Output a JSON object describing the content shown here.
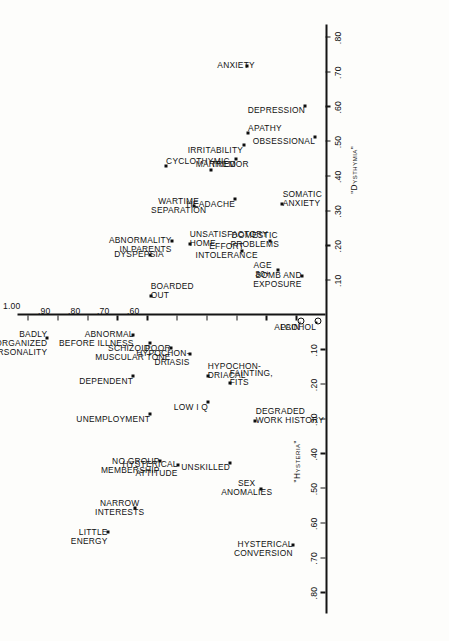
{
  "figure": {
    "axis_x_right_title": "\"Dysthymia\"",
    "axis_x_left_title": "\"Hysteria\"",
    "point_marker": "square-marker",
    "origin_marker": "circled-point-marker"
  },
  "chart_data": {
    "type": "scatter",
    "title": "",
    "xlabel": "\"Hysteria\"  ← | →  \"Dysthymia\"",
    "ylabel": "",
    "xlim": [
      -0.8,
      0.8
    ],
    "ylim": [
      0.0,
      1.0
    ],
    "grid": false,
    "legend": "none",
    "x_ticks_right": [
      ".10",
      ".20",
      ".30",
      ".40",
      ".50",
      ".60",
      ".70",
      ".80"
    ],
    "x_ticks_left": [
      ".10",
      ".20",
      ".30",
      ".40",
      ".50",
      ".60",
      ".70",
      ".80"
    ],
    "y_ticks": [
      ".10",
      ".20",
      ".30",
      ".40",
      ".50",
      ".60",
      ".70",
      ".80",
      ".90",
      "1.00"
    ],
    "points": [
      {
        "label": "BADLY\nORGANIZED\nPERSONALITY",
        "x": -0.065,
        "y": 0.935,
        "align": "right",
        "marker": "square"
      },
      {
        "label": "ABNORMAL\nBEFORE ILLNESS",
        "x": -0.055,
        "y": 0.645,
        "align": "right",
        "marker": "square"
      },
      {
        "label": "DEPENDENT",
        "x": -0.175,
        "y": 0.645,
        "align": "right",
        "marker": "square"
      },
      {
        "label": "SCHIZOID",
        "x": -0.08,
        "y": 0.59,
        "align": "right",
        "marker": "square"
      },
      {
        "label": "UNEMPLOYMENT",
        "x": -0.285,
        "y": 0.59,
        "align": "right",
        "marker": "square"
      },
      {
        "label": "POOR\nMUSCULAR TONE",
        "x": -0.095,
        "y": 0.52,
        "align": "right",
        "marker": "square"
      },
      {
        "label": "NO GROUP\nMEMBERSHIP",
        "x": -0.42,
        "y": 0.555,
        "align": "right",
        "marker": "square"
      },
      {
        "label": "HYPOCHON-\nDRIASIS",
        "x": -0.11,
        "y": 0.455,
        "align": "right",
        "marker": "square"
      },
      {
        "label": "HYSTERICAL\nATTITUDE",
        "x": -0.43,
        "y": 0.495,
        "align": "right",
        "marker": "square"
      },
      {
        "label": "HYPOCHON-\nDRIACAL",
        "x": -0.175,
        "y": 0.395,
        "align": "left",
        "marker": "square"
      },
      {
        "label": "LOW I Q",
        "x": -0.25,
        "y": 0.395,
        "align": "right",
        "marker": "square"
      },
      {
        "label": "FAINTING,\nFITS",
        "x": -0.195,
        "y": 0.32,
        "align": "left",
        "marker": "square"
      },
      {
        "label": "UNSKILLED",
        "x": -0.425,
        "y": 0.32,
        "align": "right",
        "marker": "square"
      },
      {
        "label": "DEGRADED\nWORK HISTORY",
        "x": -0.305,
        "y": 0.235,
        "align": "left",
        "marker": "square"
      },
      {
        "label": "SEX\nANOMALIES",
        "x": -0.5,
        "y": 0.215,
        "align": "center",
        "marker": "square"
      },
      {
        "label": "HYSTERICAL\nCONVERSION",
        "x": -0.66,
        "y": 0.11,
        "align": "right",
        "marker": "square"
      },
      {
        "label": "LITTLE\nENERGY",
        "x": -0.625,
        "y": 0.73,
        "align": "right",
        "marker": "square"
      },
      {
        "label": "NARROW\nINTERESTS",
        "x": -0.555,
        "y": 0.64,
        "align": "center",
        "marker": "square"
      },
      {
        "label": "PAIN",
        "x": -0.02,
        "y": 0.085,
        "align": "right",
        "marker": "circle"
      },
      {
        "label": "ALCOHOL",
        "x": -0.02,
        "y": 0.03,
        "align": "right",
        "marker": "circle"
      },
      {
        "label": "BOARDED\nOUT",
        "x": 0.055,
        "y": 0.585,
        "align": "left",
        "marker": "square"
      },
      {
        "label": "DYSPEPSIA",
        "x": 0.175,
        "y": 0.59,
        "align": "center",
        "marker": "square"
      },
      {
        "label": "ABNORMALITY\nIN PARENTS",
        "x": 0.215,
        "y": 0.515,
        "align": "right",
        "marker": "square"
      },
      {
        "label": "CYCLOTHYMIC",
        "x": 0.43,
        "y": 0.535,
        "align": "left",
        "marker": "square"
      },
      {
        "label": "UNSATISFACTORY\nHOME",
        "x": 0.205,
        "y": 0.455,
        "align": "left",
        "marker": "square"
      },
      {
        "label": "WARTIME\nSEPARATION",
        "x": 0.315,
        "y": 0.44,
        "align": "center",
        "marker": "square"
      },
      {
        "label": "TREMOR",
        "x": 0.42,
        "y": 0.385,
        "align": "left",
        "marker": "square"
      },
      {
        "label": "EFFORT\nINTOLERANCE",
        "x": 0.185,
        "y": 0.28,
        "align": "center",
        "marker": "square"
      },
      {
        "label": "HEADACHE",
        "x": 0.335,
        "y": 0.305,
        "align": "right",
        "marker": "square"
      },
      {
        "label": "MARRIED",
        "x": 0.45,
        "y": 0.3,
        "align": "right",
        "marker": "square"
      },
      {
        "label": "IRRITABILITY",
        "x": 0.49,
        "y": 0.275,
        "align": "right",
        "marker": "square"
      },
      {
        "label": "APATHY",
        "x": 0.525,
        "y": 0.26,
        "align": "left",
        "marker": "square"
      },
      {
        "label": "ANXIETY",
        "x": 0.72,
        "y": 0.265,
        "align": "center",
        "marker": "square"
      },
      {
        "label": "AGE\n30+",
        "x": 0.13,
        "y": 0.16,
        "align": "center",
        "marker": "square"
      },
      {
        "label": "DOMESTIC\nPROBLEMS",
        "x": 0.215,
        "y": 0.185,
        "align": "center",
        "marker": "square"
      },
      {
        "label": "SOMATIC\nANXIETY",
        "x": 0.32,
        "y": 0.145,
        "align": "left",
        "marker": "square"
      },
      {
        "label": "BOMB AND\nEXPOSURE",
        "x": 0.115,
        "y": 0.08,
        "align": "right",
        "marker": "square"
      },
      {
        "label": "OBSESSIONAL",
        "x": 0.515,
        "y": 0.035,
        "align": "right",
        "marker": "square"
      },
      {
        "label": "DEPRESSION",
        "x": 0.605,
        "y": 0.07,
        "align": "right",
        "marker": "square"
      }
    ]
  }
}
